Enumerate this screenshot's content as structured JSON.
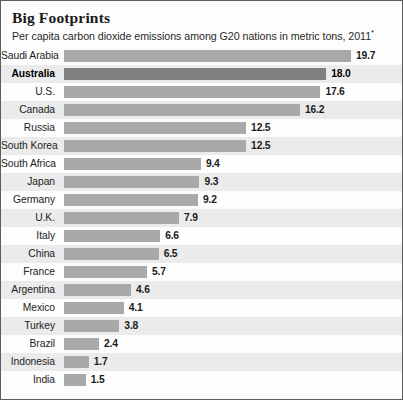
{
  "header": {
    "title": "Big Footprints",
    "subtitle": "Per capita carbon dioxide emissions among G20 nations in metric tons, 2011",
    "footnote_marker": "*"
  },
  "chart_data": {
    "type": "bar",
    "orientation": "horizontal",
    "title": "Big Footprints",
    "subtitle": "Per capita carbon dioxide emissions among G20 nations in metric tons, 2011*",
    "xlabel": "",
    "ylabel": "",
    "unit": "metric tons per capita",
    "year": "2011",
    "xlim": [
      0,
      19.7
    ],
    "grid": false,
    "legend": false,
    "value_labels": true,
    "sorted": "descending",
    "highlight_category": "Australia",
    "bar_color": "#a9a9a9",
    "highlight_bar_color": "#808080",
    "row_band_color": "#ebebeb",
    "categories": [
      "Saudi Arabia",
      "Australia",
      "U.S.",
      "Canada",
      "Russia",
      "South Korea",
      "South Africa",
      "Japan",
      "Germany",
      "U.K.",
      "Italy",
      "China",
      "France",
      "Argentina",
      "Mexico",
      "Turkey",
      "Brazil",
      "Indonesia",
      "India"
    ],
    "values": [
      19.7,
      18.0,
      17.6,
      16.2,
      12.5,
      12.5,
      9.4,
      9.3,
      9.2,
      7.9,
      6.6,
      6.5,
      5.7,
      4.6,
      4.1,
      3.8,
      2.4,
      1.7,
      1.5
    ],
    "value_label_texts": [
      "19.7",
      "18.0",
      "17.6",
      "16.2",
      "12.5",
      "12.5",
      "9.4",
      "9.3",
      "9.2",
      "7.9",
      "6.6",
      "6.5",
      "5.7",
      "4.6",
      "4.1",
      "3.8",
      "2.4",
      "1.7",
      "1.5"
    ],
    "rows": [
      {
        "label": "Saudi Arabia",
        "value": 19.7,
        "value_label": "19.7",
        "highlight": false
      },
      {
        "label": "Australia",
        "value": 18.0,
        "value_label": "18.0",
        "highlight": true
      },
      {
        "label": "U.S.",
        "value": 17.6,
        "value_label": "17.6",
        "highlight": false
      },
      {
        "label": "Canada",
        "value": 16.2,
        "value_label": "16.2",
        "highlight": false
      },
      {
        "label": "Russia",
        "value": 12.5,
        "value_label": "12.5",
        "highlight": false
      },
      {
        "label": "South Korea",
        "value": 12.5,
        "value_label": "12.5",
        "highlight": false
      },
      {
        "label": "South Africa",
        "value": 9.4,
        "value_label": "9.4",
        "highlight": false
      },
      {
        "label": "Japan",
        "value": 9.3,
        "value_label": "9.3",
        "highlight": false
      },
      {
        "label": "Germany",
        "value": 9.2,
        "value_label": "9.2",
        "highlight": false
      },
      {
        "label": "U.K.",
        "value": 7.9,
        "value_label": "7.9",
        "highlight": false
      },
      {
        "label": "Italy",
        "value": 6.6,
        "value_label": "6.6",
        "highlight": false
      },
      {
        "label": "China",
        "value": 6.5,
        "value_label": "6.5",
        "highlight": false
      },
      {
        "label": "France",
        "value": 5.7,
        "value_label": "5.7",
        "highlight": false
      },
      {
        "label": "Argentina",
        "value": 4.6,
        "value_label": "4.6",
        "highlight": false
      },
      {
        "label": "Mexico",
        "value": 4.1,
        "value_label": "4.1",
        "highlight": false
      },
      {
        "label": "Turkey",
        "value": 3.8,
        "value_label": "3.8",
        "highlight": false
      },
      {
        "label": "Brazil",
        "value": 2.4,
        "value_label": "2.4",
        "highlight": false
      },
      {
        "label": "Indonesia",
        "value": 1.7,
        "value_label": "1.7",
        "highlight": false
      },
      {
        "label": "India",
        "value": 1.5,
        "value_label": "1.5",
        "highlight": false
      }
    ]
  }
}
